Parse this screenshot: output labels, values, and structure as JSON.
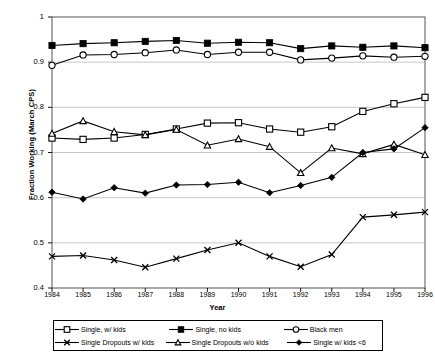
{
  "chart_data": {
    "type": "line",
    "title": "",
    "xlabel": "Year",
    "ylabel": "Fraction Working (March CPS)",
    "xlim": [
      1984,
      1996
    ],
    "ylim": [
      0.4,
      1.0
    ],
    "ytick_labels": [
      "1",
      "0.9",
      "0.8",
      "0.7",
      "0.6",
      "0.5",
      "0.4"
    ],
    "ytick_values": [
      1.0,
      0.9,
      0.8,
      0.7,
      0.6,
      0.5,
      0.4
    ],
    "grid": "horizontal",
    "legend_position": "bottom",
    "categories": [
      1984,
      1985,
      1986,
      1987,
      1988,
      1989,
      1990,
      1991,
      1992,
      1993,
      1994,
      1995,
      1996
    ],
    "xtick_labels": [
      "1984",
      "1985",
      "1986",
      "1987",
      "1988",
      "1989",
      "1990",
      "1991",
      "1992",
      "1993",
      "1994",
      "1995",
      "1996"
    ],
    "series": [
      {
        "name": "Single, w/ kids",
        "marker": "open-square",
        "color": "#000000",
        "values": [
          0.732,
          0.729,
          0.732,
          0.74,
          0.752,
          0.765,
          0.766,
          0.752,
          0.745,
          0.757,
          0.791,
          0.808,
          0.822
        ]
      },
      {
        "name": "Single, no kids",
        "marker": "filled-square",
        "color": "#000000",
        "values": [
          0.937,
          0.941,
          0.943,
          0.946,
          0.948,
          0.942,
          0.944,
          0.943,
          0.93,
          0.936,
          0.933,
          0.936,
          0.932
        ]
      },
      {
        "name": "Black men",
        "marker": "open-circle",
        "color": "#000000",
        "values": [
          0.893,
          0.916,
          0.917,
          0.921,
          0.927,
          0.917,
          0.922,
          0.922,
          0.905,
          0.909,
          0.914,
          0.911,
          0.913
        ]
      },
      {
        "name": "Single Dropouts w/ kids",
        "marker": "cross-x",
        "color": "#000000",
        "values": [
          0.47,
          0.472,
          0.462,
          0.446,
          0.465,
          0.484,
          0.5,
          0.47,
          0.447,
          0.474,
          0.557,
          0.562,
          0.568
        ]
      },
      {
        "name": "Single Dropouts w/o kids",
        "marker": "open-triangle",
        "color": "#000000",
        "values": [
          0.742,
          0.77,
          0.746,
          0.739,
          0.751,
          0.716,
          0.73,
          0.713,
          0.655,
          0.71,
          0.697,
          0.718,
          0.695
        ]
      },
      {
        "name": "Single w/ kids <6",
        "marker": "filled-diamond",
        "color": "#000000",
        "values": [
          0.612,
          0.597,
          0.622,
          0.61,
          0.628,
          0.629,
          0.634,
          0.611,
          0.627,
          0.645,
          0.7,
          0.708,
          0.755
        ]
      }
    ]
  },
  "legend": {
    "items": [
      {
        "label": "Single, w/ kids",
        "marker": "open-square"
      },
      {
        "label": "Single, no kids",
        "marker": "filled-square"
      },
      {
        "label": "Black men",
        "marker": "open-circle"
      },
      {
        "label": "Single Dropouts w/ kids",
        "marker": "cross-x"
      },
      {
        "label": "Single Dropouts w/o kids",
        "marker": "open-triangle"
      },
      {
        "label": "Single w/ kids <6",
        "marker": "filled-diamond"
      }
    ]
  }
}
